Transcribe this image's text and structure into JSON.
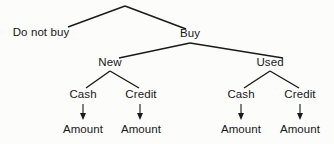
{
  "diagram": {
    "type": "decision-tree",
    "background_color": "#fcfcfb",
    "line_color": "#1a1a1c",
    "text_color": "#18181a",
    "nodes": {
      "root_left": "Do not buy",
      "root_right": "Buy",
      "buy_left": "New",
      "buy_right": "Used",
      "new_left": "Cash",
      "new_right": "Credit",
      "used_left": "Cash",
      "used_right": "Credit",
      "leaf_1": "Amount",
      "leaf_2": "Amount",
      "leaf_3": "Amount",
      "leaf_4": "Amount"
    },
    "arrows": {
      "arrow_1": "down-arrow",
      "arrow_2": "down-arrow",
      "arrow_3": "down-arrow",
      "arrow_4": "down-arrow"
    }
  }
}
